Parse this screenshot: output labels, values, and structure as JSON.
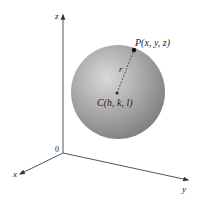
{
  "figure": {
    "type": "sphere-in-3d-axes",
    "axes": {
      "z_label": "z",
      "x_label": "x",
      "y_label": "y",
      "origin_label": "0"
    },
    "sphere": {
      "color_highlight": "#d8d8d8",
      "color_mid": "#a9a9a9",
      "color_shadow": "#7d7d7d"
    },
    "points": {
      "center_label": "C(h, k, l)",
      "point_label": "P(x, y, z)",
      "radius_label": "r"
    }
  }
}
